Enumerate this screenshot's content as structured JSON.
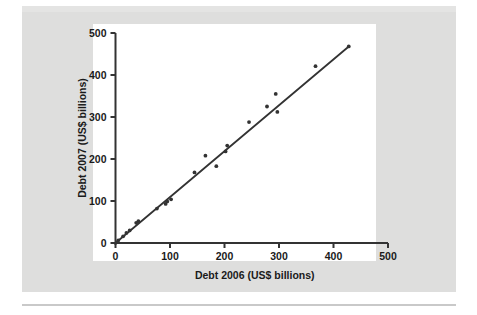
{
  "figure": {
    "background_color": "#dededd",
    "plot_background_color": "#ffffff",
    "ink_color": "#333333"
  },
  "chart_data": {
    "type": "scatter",
    "title": "",
    "xlabel": "Debt 2006 (US$ billions)",
    "ylabel": "Debt 2007 (US$ billions)",
    "xlim": [
      0,
      500
    ],
    "ylim": [
      0,
      500
    ],
    "xticks": [
      0,
      100,
      200,
      300,
      400,
      500
    ],
    "yticks": [
      0,
      100,
      200,
      300,
      400,
      500
    ],
    "grid": false,
    "legend": null,
    "series": [
      {
        "name": "Countries",
        "marker": "dot",
        "color": "#333333",
        "points": [
          {
            "x": 5,
            "y": 6
          },
          {
            "x": 14,
            "y": 16
          },
          {
            "x": 20,
            "y": 24
          },
          {
            "x": 26,
            "y": 30
          },
          {
            "x": 38,
            "y": 48
          },
          {
            "x": 42,
            "y": 52
          },
          {
            "x": 76,
            "y": 82
          },
          {
            "x": 92,
            "y": 93
          },
          {
            "x": 95,
            "y": 99
          },
          {
            "x": 102,
            "y": 104
          },
          {
            "x": 145,
            "y": 168
          },
          {
            "x": 165,
            "y": 208
          },
          {
            "x": 185,
            "y": 183
          },
          {
            "x": 202,
            "y": 218
          },
          {
            "x": 205,
            "y": 232
          },
          {
            "x": 245,
            "y": 288
          },
          {
            "x": 278,
            "y": 325
          },
          {
            "x": 294,
            "y": 355
          },
          {
            "x": 297,
            "y": 312
          },
          {
            "x": 367,
            "y": 421
          },
          {
            "x": 428,
            "y": 468
          }
        ]
      }
    ],
    "trend_line": {
      "name": "Fitted line",
      "color": "#333333",
      "x_start": 0,
      "y_start": 0,
      "x_end": 428,
      "y_end": 468
    }
  }
}
